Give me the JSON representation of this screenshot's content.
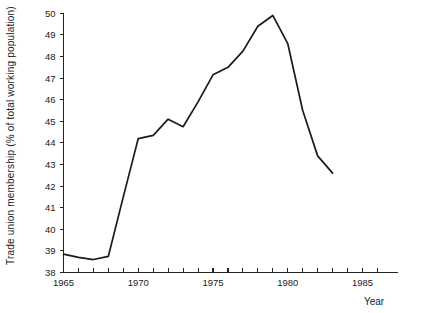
{
  "chart_data": {
    "type": "line",
    "title": "",
    "subtitle": "",
    "xlabel": "Year",
    "ylabel": "Trade union membership (% of total working population)",
    "xlim": [
      1965,
      1986
    ],
    "ylim": [
      38,
      50
    ],
    "grid": false,
    "legend": false,
    "legend_position": "none",
    "x_tick_interval": 1,
    "x_labeled_ticks": [
      "1965",
      "1970",
      "1975",
      "1980",
      "1985"
    ],
    "x_labeled_values": [
      1965,
      1970,
      1975,
      1980,
      1985
    ],
    "y_ticks": [
      "38",
      "39",
      "40",
      "41",
      "42",
      "43",
      "44",
      "45",
      "46",
      "47",
      "48",
      "49",
      "50"
    ],
    "y_tick_values": [
      38,
      39,
      40,
      41,
      42,
      43,
      44,
      45,
      46,
      47,
      48,
      49,
      50
    ],
    "x": [
      1965,
      1966,
      1967,
      1968,
      1969,
      1970,
      1971,
      1972,
      1973,
      1974,
      1975,
      1976,
      1977,
      1978,
      1979,
      1980,
      1981,
      1982,
      1983
    ],
    "values": [
      38.85,
      38.7,
      38.6,
      38.75,
      41.5,
      44.2,
      44.35,
      45.1,
      44.75,
      45.9,
      47.15,
      47.5,
      48.25,
      49.4,
      49.9,
      48.6,
      45.5,
      43.4,
      42.6
    ],
    "series": [
      {
        "name": "Trade union membership",
        "color": "#1b1b1b",
        "values": [
          38.85,
          38.7,
          38.6,
          38.75,
          41.5,
          44.2,
          44.35,
          45.1,
          44.75,
          45.9,
          47.15,
          47.5,
          48.25,
          49.4,
          49.9,
          48.6,
          45.5,
          43.4,
          42.6
        ]
      }
    ],
    "annotations": []
  }
}
